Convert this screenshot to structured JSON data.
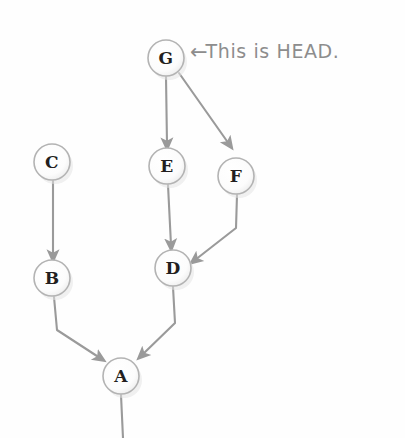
{
  "diagram": {
    "background_color": "#fefefe",
    "node_stroke_color": "#b3b3b3",
    "node_fill_color": "#fdfdfd",
    "node_text_color": "#231f20",
    "edge_color": "#9a9a9a",
    "annotation_color": "#8d8d8d",
    "node_radius": 18,
    "nodes": [
      {
        "id": "G",
        "label": "G",
        "cx": 166,
        "cy": 58
      },
      {
        "id": "C",
        "label": "C",
        "cx": 52,
        "cy": 162
      },
      {
        "id": "E",
        "label": "E",
        "cx": 167,
        "cy": 166
      },
      {
        "id": "F",
        "label": "F",
        "cx": 236,
        "cy": 176
      },
      {
        "id": "B",
        "label": "B",
        "cx": 52,
        "cy": 278
      },
      {
        "id": "D",
        "label": "D",
        "cx": 173,
        "cy": 268
      },
      {
        "id": "A",
        "label": "A",
        "cx": 121,
        "cy": 376
      }
    ],
    "edges": [
      {
        "from": "G",
        "to": "E",
        "points": "166,77 167,146"
      },
      {
        "from": "G",
        "to": "F",
        "points": "179,73 230,146"
      },
      {
        "from": "C",
        "to": "B",
        "points": "53,181 53,258"
      },
      {
        "from": "E",
        "to": "D",
        "points": "168,185 171,247"
      },
      {
        "from": "F",
        "to": "D",
        "points": "237,195 236,228 193,261"
      },
      {
        "from": "B",
        "to": "A",
        "points": "54,297 57,330 102,360"
      },
      {
        "from": "D",
        "to": "A",
        "points": "173,287 175,323 140,357"
      }
    ],
    "tail": {
      "from": "A",
      "points": "121,395 123,438"
    },
    "annotation": {
      "arrow_glyph": "←",
      "text": "This is HEAD.",
      "points_to": "G",
      "x": 190,
      "y": 43
    }
  }
}
